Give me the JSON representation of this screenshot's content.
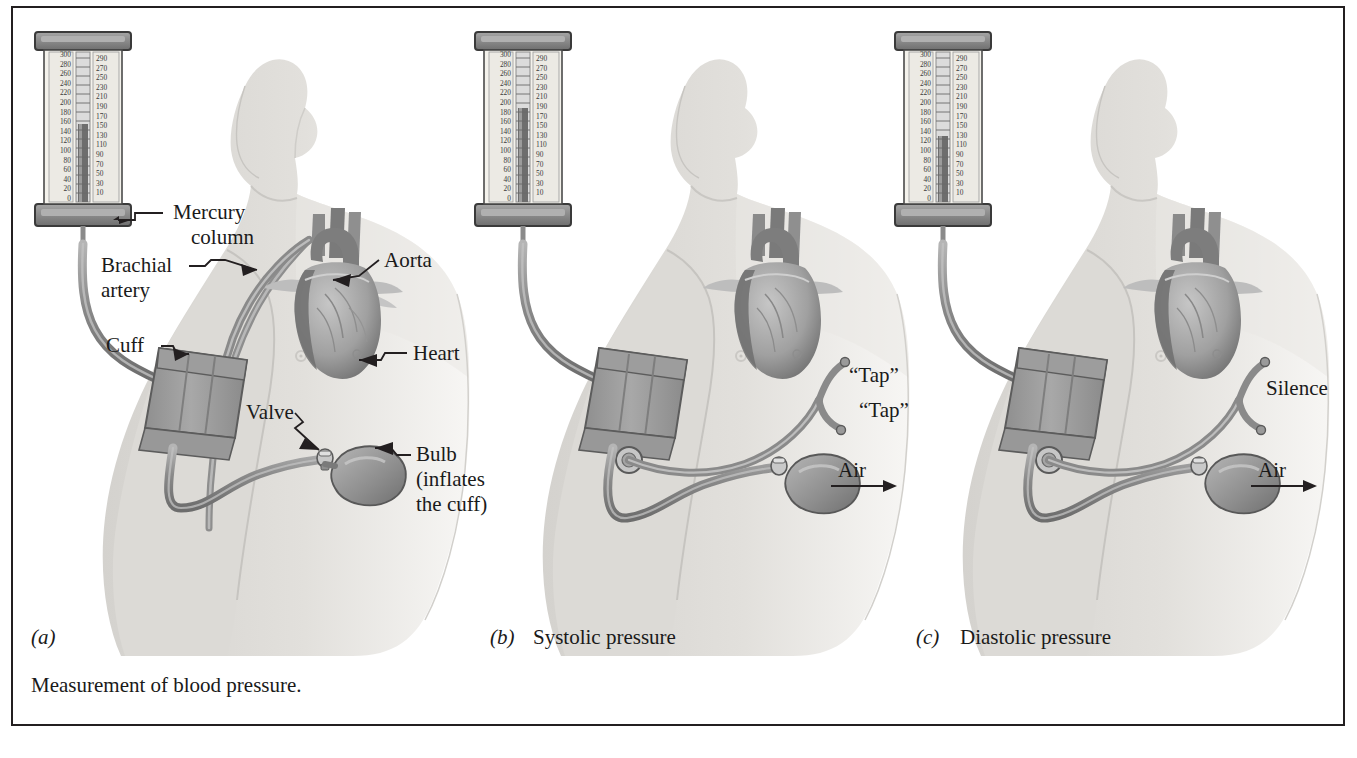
{
  "figure": {
    "caption": "Measurement of blood pressure.",
    "panels": [
      {
        "id": "a",
        "tag": "(a)",
        "title": ""
      },
      {
        "id": "b",
        "tag": "(b)",
        "title": "Systolic pressure"
      },
      {
        "id": "c",
        "tag": "(c)",
        "title": "Diastolic pressure"
      }
    ]
  },
  "manometer": {
    "left_scale": [
      "300",
      "280",
      "260",
      "240",
      "220",
      "200",
      "180",
      "160",
      "140",
      "120",
      "100",
      "80",
      "60",
      "40",
      "20",
      "0"
    ],
    "right_scale": [
      "290",
      "270",
      "250",
      "230",
      "210",
      "190",
      "170",
      "150",
      "130",
      "110",
      "90",
      "70",
      "50",
      "30",
      "10"
    ],
    "cap_color": "#8c8c8c",
    "tube_color": "#9a9a9a",
    "body_color": "#f2f0ea"
  },
  "panel_a": {
    "labels": {
      "mercury_column_line1": "Mercury",
      "mercury_column_line2": "column",
      "brachial_artery_line1": "Brachial",
      "brachial_artery_line2": "artery",
      "cuff": "Cuff",
      "aorta": "Aorta",
      "heart": "Heart",
      "valve": "Valve",
      "bulb_line1": "Bulb",
      "bulb_line2": "(inflates",
      "bulb_line3": "the cuff)"
    }
  },
  "panel_b": {
    "labels": {
      "tap1": "“Tap”",
      "tap2": "“Tap”",
      "air": "Air"
    }
  },
  "panel_c": {
    "labels": {
      "silence": "Silence",
      "air": "Air"
    }
  },
  "colors": {
    "border": "#231f20",
    "body_fill": "#dedcd8",
    "body_fill_light": "#e8e6e2",
    "tube": "#8a8a8a",
    "cuff": "#9e9e9e",
    "heart_dark": "#6f6f6f",
    "heart_mid": "#9b9b9b",
    "heart_light": "#c0c0c0",
    "text": "#1a1a1a"
  }
}
